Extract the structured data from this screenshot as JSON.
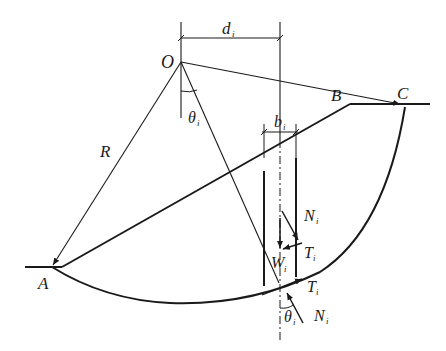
{
  "diagram": {
    "type": "slope-stability-slice-method",
    "labels": {
      "center": "O",
      "radius": "R",
      "toe": "A",
      "crest": "B",
      "arc_end": "C",
      "moment_arm": "d",
      "moment_arm_sub": "i",
      "slice_width": "b",
      "slice_width_sub": "i",
      "angle": "θ",
      "angle_sub": "i",
      "weight": "W",
      "weight_sub": "i",
      "normal_force": "N",
      "normal_force_sub": "i",
      "shear_force": "T",
      "shear_force_sub": "i"
    },
    "colors": {
      "stroke": "#1a1a1a",
      "background": "#ffffff"
    }
  }
}
